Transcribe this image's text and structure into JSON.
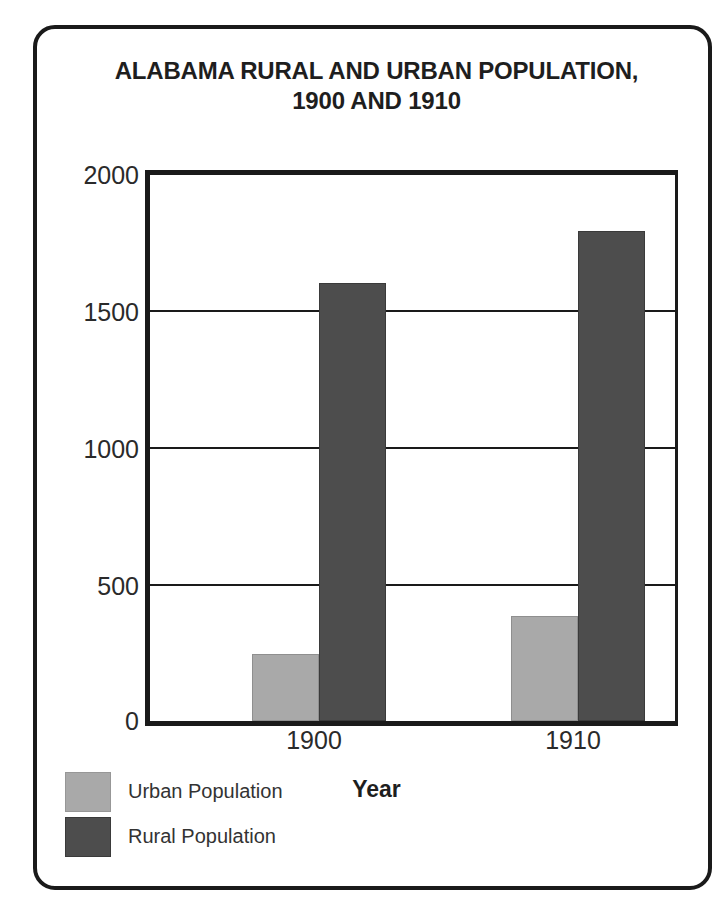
{
  "chart_data": {
    "type": "bar",
    "title": "ALABAMA RURAL AND URBAN POPULATION, 1900 AND 1910",
    "title_lines": [
      "ALABAMA RURAL AND URBAN POPULATION,",
      "1900 AND 1910"
    ],
    "xlabel": "Year",
    "ylabel": "Population (thousands)",
    "categories": [
      "1900",
      "1910"
    ],
    "series": [
      {
        "name": "Urban Population",
        "values": [
          245,
          385
        ],
        "color": "#a9a9a9"
      },
      {
        "name": "Rural Population",
        "values": [
          1600,
          1790
        ],
        "color": "#4d4d4d"
      }
    ],
    "ylim": [
      0,
      2000
    ],
    "yticks": [
      0,
      500,
      1000,
      1500,
      2000
    ],
    "ytick_labels": [
      "0",
      "500",
      "1000",
      "1500",
      "2000"
    ],
    "grid": true,
    "grid_axis": "y",
    "legend_position": "bottom-left",
    "frame_color": "#1a1a1a"
  }
}
